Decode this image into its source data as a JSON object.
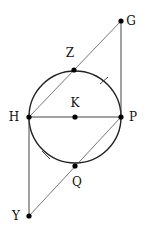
{
  "diagram": {
    "type": "geometry",
    "circle": {
      "center": "K",
      "cx": 75,
      "cy": 117,
      "r": 46
    },
    "points": {
      "G": {
        "label": "G",
        "x": 121,
        "y": 21,
        "lx": 131,
        "ly": 21
      },
      "Z": {
        "label": "Z",
        "x": 74,
        "y": 70,
        "lx": 70,
        "ly": 53
      },
      "H": {
        "label": "H",
        "x": 29,
        "y": 117,
        "lx": 14,
        "ly": 117
      },
      "K": {
        "label": "K",
        "x": 75,
        "y": 117,
        "lx": 75,
        "ly": 103
      },
      "P": {
        "label": "P",
        "x": 121,
        "y": 117,
        "lx": 133,
        "ly": 117
      },
      "Q": {
        "label": "Q",
        "x": 75,
        "y": 166,
        "lx": 77,
        "ly": 182
      },
      "Y": {
        "label": "Y",
        "x": 29,
        "y": 216,
        "lx": 16,
        "ly": 216
      }
    },
    "segments": [
      {
        "from": "H",
        "to": "G"
      },
      {
        "from": "G",
        "to": "P"
      },
      {
        "from": "H",
        "to": "P"
      },
      {
        "from": "P",
        "to": "Y"
      },
      {
        "from": "H",
        "to": "Y"
      }
    ],
    "tick_marks": [
      {
        "arc": "ZP",
        "x1": 100,
        "y1": 84,
        "x2": 108,
        "y2": 77
      },
      {
        "arc": "HQ",
        "x1": 42,
        "y1": 151,
        "x2": 50,
        "y2": 159
      }
    ]
  }
}
